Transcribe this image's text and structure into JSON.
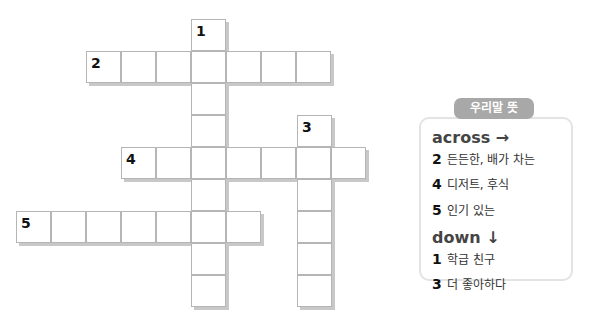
{
  "puzzle": {
    "cell_width": 35,
    "cell_height": 32,
    "words": [
      {
        "number": "1",
        "direction": "down",
        "x": 191,
        "y": 19,
        "length": 9
      },
      {
        "number": "2",
        "direction": "across",
        "x": 86,
        "y": 51,
        "length": 7
      },
      {
        "number": "3",
        "direction": "down",
        "x": 297,
        "y": 115,
        "length": 6
      },
      {
        "number": "4",
        "direction": "across",
        "x": 121,
        "y": 147,
        "length": 7
      },
      {
        "number": "5",
        "direction": "across",
        "x": 16,
        "y": 211,
        "length": 7
      }
    ]
  },
  "clues": {
    "title": "우리말 뜻",
    "across_label": "across →",
    "across": [
      {
        "number": "2",
        "text": "든든한, 배가 차는"
      },
      {
        "number": "4",
        "text": "디저트, 후식"
      },
      {
        "number": "5",
        "text": "인기 있는"
      }
    ],
    "down_label": "down ↓",
    "down": [
      {
        "number": "1",
        "text": "학급 친구"
      },
      {
        "number": "3",
        "text": "더 좋아하다"
      }
    ]
  }
}
